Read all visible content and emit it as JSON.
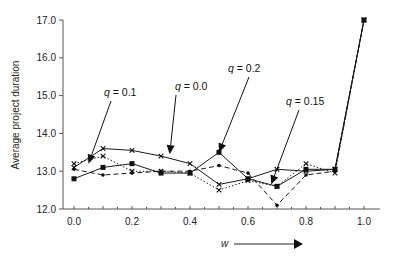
{
  "chart_data": {
    "type": "line",
    "title": "",
    "xlabel": "w",
    "ylabel": "Average project duration",
    "xlim": [
      0.0,
      1.0
    ],
    "ylim": [
      12.0,
      17.0
    ],
    "x": [
      0.0,
      0.1,
      0.2,
      0.3,
      0.4,
      0.5,
      0.6,
      0.7,
      0.8,
      0.9,
      1.0
    ],
    "x_ticks": [
      "0.0",
      "0.2",
      "0.4",
      "0.6",
      "0.8",
      "1.0"
    ],
    "x_tick_values": [
      0.0,
      0.2,
      0.4,
      0.6,
      0.8,
      1.0
    ],
    "y_ticks": [
      "12.0",
      "13.0",
      "14.0",
      "15.0",
      "16.0",
      "17.0"
    ],
    "y_tick_values": [
      12.0,
      13.0,
      14.0,
      15.0,
      16.0,
      17.0
    ],
    "grid": false,
    "legend": "none (inline annotations with arrows)",
    "series": [
      {
        "name": "q = 0.0",
        "style": "solid",
        "marker": "x",
        "values": [
          13.1,
          13.6,
          13.55,
          13.4,
          13.2,
          12.65,
          12.8,
          13.05,
          13.0,
          13.05,
          17.0
        ]
      },
      {
        "name": "q = 0.1",
        "style": "dotted",
        "marker": "x",
        "values": [
          13.2,
          13.4,
          13.0,
          13.0,
          12.95,
          12.5,
          12.75,
          12.6,
          13.2,
          12.95,
          17.0
        ]
      },
      {
        "name": "q = 0.15",
        "style": "dashed",
        "marker": "dot",
        "values": [
          13.05,
          12.9,
          12.95,
          13.0,
          13.0,
          13.15,
          12.95,
          12.1,
          12.9,
          13.0,
          17.0
        ]
      },
      {
        "name": "q = 0.2",
        "style": "solid",
        "marker": "square",
        "values": [
          12.8,
          13.1,
          13.2,
          12.95,
          12.95,
          13.5,
          12.8,
          12.6,
          13.05,
          13.05,
          17.0
        ]
      }
    ],
    "annotations": [
      {
        "q": "q",
        "text": " = 0.1",
        "points_to": {
          "x": 0.05,
          "y": 13.2
        }
      },
      {
        "q": "q",
        "text": " = 0.0",
        "points_to": {
          "x": 0.33,
          "y": 13.45
        }
      },
      {
        "q": "q",
        "text": " = 0.2",
        "points_to": {
          "x": 0.5,
          "y": 13.5
        }
      },
      {
        "q": "q",
        "text": " = 0.15",
        "points_to": {
          "x": 0.68,
          "y": 12.65
        }
      }
    ],
    "x_arrow_label": "w",
    "colors": {
      "line": "#1a1a1a",
      "axis": "#444444",
      "text": "#222222"
    }
  }
}
